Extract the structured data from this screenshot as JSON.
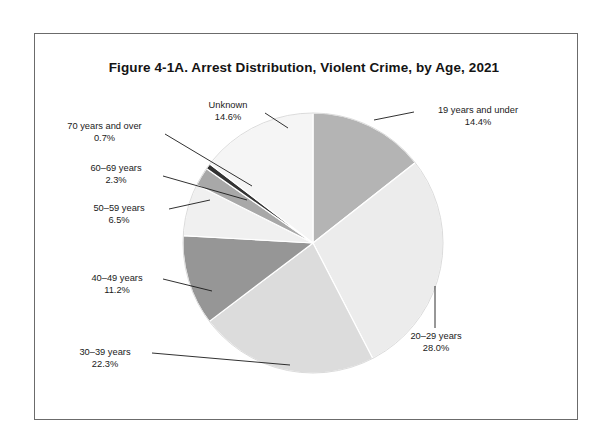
{
  "figure": {
    "title": "Figure 4-1A. Arrest Distribution, Violent Crime, by Age, 2021",
    "frame_color": "#6b6b6b",
    "background": "#ffffff"
  },
  "chart_data": {
    "type": "pie",
    "title": "Figure 4-1A. Arrest Distribution, Violent Crime, by Age, 2021",
    "xlabel": "",
    "ylabel": "",
    "units": "percent",
    "legend": "none (direct callout labels)",
    "start_angle_deg": 0,
    "direction": "clockwise",
    "categories": [
      "19 years and under",
      "20–29 years",
      "30–39 years",
      "40–49 years",
      "50–59 years",
      "60–69 years",
      "70 years and over",
      "Unknown"
    ],
    "values": [
      14.4,
      28.0,
      22.3,
      11.2,
      6.5,
      2.3,
      0.7,
      14.6
    ],
    "value_labels": [
      "14.4%",
      "28.0%",
      "22.3%",
      "11.2%",
      "6.5%",
      "2.3%",
      "0.7%",
      "14.6%"
    ],
    "colors": [
      "#b4b4b4",
      "#ececec",
      "#dcdcdc",
      "#969696",
      "#f0f0f0",
      "#a8a8a8",
      "#333333",
      "#f5f5f5"
    ],
    "slice_border_color": "#ffffff",
    "slices": [
      {
        "label": "19 years and under",
        "value": 14.4,
        "value_label": "14.4%",
        "color": "#b4b4b4"
      },
      {
        "label": "20–29 years",
        "value": 28.0,
        "value_label": "28.0%",
        "color": "#ececec"
      },
      {
        "label": "30–39 years",
        "value": 22.3,
        "value_label": "22.3%",
        "color": "#dcdcdc"
      },
      {
        "label": "40–49 years",
        "value": 11.2,
        "value_label": "11.2%",
        "color": "#969696"
      },
      {
        "label": "50–59 years",
        "value": 6.5,
        "value_label": "6.5%",
        "color": "#f0f0f0"
      },
      {
        "label": "60–69 years",
        "value": 2.3,
        "value_label": "2.3%",
        "color": "#a8a8a8"
      },
      {
        "label": "70 years and over",
        "value": 0.7,
        "value_label": "0.7%",
        "color": "#333333"
      },
      {
        "label": "Unknown",
        "value": 14.6,
        "value_label": "14.6%",
        "color": "#f5f5f5"
      }
    ]
  },
  "labels": {
    "unknown": {
      "name": "Unknown",
      "value": "14.6%"
    },
    "seventy_plus": {
      "name": "70 years and over",
      "value": "0.7%"
    },
    "sixty_sixtynine": {
      "name": "60–69 years",
      "value": "2.3%"
    },
    "fifty_fiftynine": {
      "name": "50–59 years",
      "value": "6.5%"
    },
    "forty_fortynine": {
      "name": "40–49 years",
      "value": "11.2%"
    },
    "thirty_thirtynine": {
      "name": "30–39 years",
      "value": "22.3%"
    },
    "nineteen_under": {
      "name": "19 years and under",
      "value": "14.4%"
    },
    "twenty_twentynine": {
      "name": "20–29 years",
      "value": "28.0%"
    }
  }
}
